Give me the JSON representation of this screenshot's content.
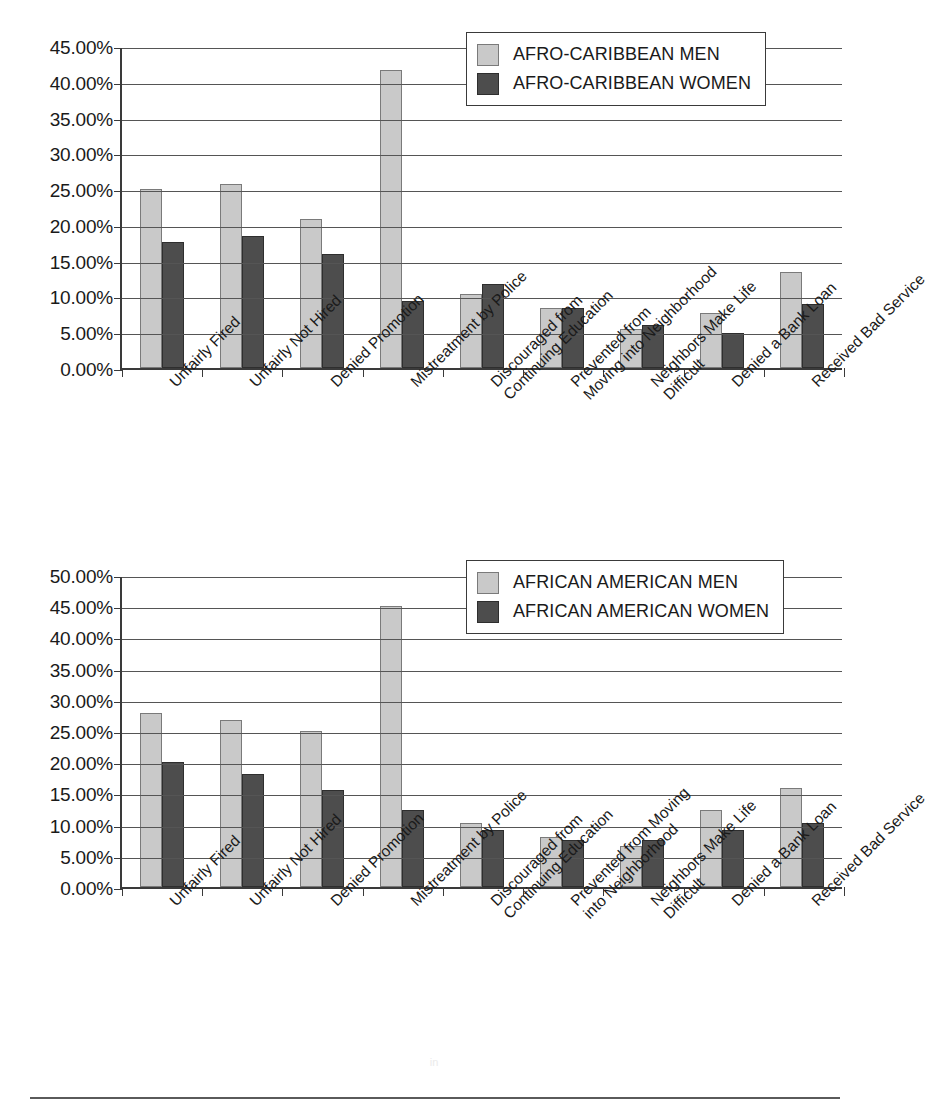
{
  "page": {
    "title_remnant": "",
    "footer_ghost": "in"
  },
  "chart_data": [
    {
      "id": "afro-caribbean",
      "type": "bar",
      "title": "",
      "xlabel": "",
      "ylabel": "",
      "ylim": [
        0,
        45
      ],
      "ytick_step": 5,
      "grid": true,
      "legend_position": "top-right",
      "ytick_labels": [
        "45.00%",
        "40.00%",
        "35.00%",
        "30.00%",
        "25.00%",
        "20.00%",
        "15.00%",
        "10.00%",
        "5.00%",
        "0.00%"
      ],
      "categories": [
        "Unfairly Fired",
        "Unfairly Not Hired",
        "Denied Promotion",
        "Mistreatment by Police",
        "Discouraged from Continuing Education",
        "Prevented from Moving into Neighborhood",
        "Neighbors Make Life Difficult",
        "Denied a Bank Loan",
        "Received Bad Service"
      ],
      "category_lines": [
        [
          "Unfairly Fired",
          ""
        ],
        [
          "Unfairly Not Hired",
          ""
        ],
        [
          "Denied Promotion",
          ""
        ],
        [
          "Mistreatment by Police",
          ""
        ],
        [
          "Discouraged from",
          "Continuing Education"
        ],
        [
          "Prevented from",
          "Moving into Neighborhood"
        ],
        [
          "Neighbors Make Life",
          "Difficult"
        ],
        [
          "Denied a Bank Loan",
          ""
        ],
        [
          "Received Bad Service",
          ""
        ]
      ],
      "series": [
        {
          "name": "AFRO-CARIBBEAN MEN",
          "color": "#c9c9c9",
          "values": [
            25.0,
            25.7,
            20.8,
            41.7,
            10.4,
            8.4,
            5.4,
            7.7,
            13.4
          ]
        },
        {
          "name": "AFRO-CARIBBEAN WOMEN",
          "color": "#4d4d4d",
          "values": [
            17.6,
            18.4,
            15.9,
            9.3,
            11.7,
            8.4,
            6.0,
            4.9,
            9.0
          ]
        }
      ]
    },
    {
      "id": "african-american",
      "type": "bar",
      "title": "",
      "xlabel": "",
      "ylabel": "",
      "ylim": [
        0,
        50
      ],
      "ytick_step": 5,
      "grid": true,
      "legend_position": "top-right",
      "ytick_labels": [
        "50.00%",
        "45.00%",
        "40.00%",
        "35.00%",
        "30.00%",
        "25.00%",
        "20.00%",
        "15.00%",
        "10.00%",
        "5.00%",
        "0.00%"
      ],
      "categories": [
        "Unfairly Fired",
        "Unfairly Not Hired",
        "Denied Promotion",
        "Mistreatment by Police",
        "Discouraged from Continuing Education",
        "Prevented from Moving into Neighborhood",
        "Neighbors Make Life Difficult",
        "Denied a Bank Loan",
        "Received Bad Service"
      ],
      "category_lines": [
        [
          "Unfairly Fired",
          ""
        ],
        [
          "Unfairly Not Hired",
          ""
        ],
        [
          "Denied Promotion",
          ""
        ],
        [
          "Mistreatment by Police",
          ""
        ],
        [
          "Discouraged from",
          "Continuing Education"
        ],
        [
          "Prevented from Moving",
          "into Neighborhood"
        ],
        [
          "Neighbors Make Life",
          "Difficult"
        ],
        [
          "Denied a Bank Loan",
          ""
        ],
        [
          "Received Bad Service",
          ""
        ]
      ],
      "series": [
        {
          "name": "AFRICAN AMERICAN MEN",
          "color": "#c9c9c9",
          "values": [
            27.9,
            26.7,
            25.0,
            45.0,
            10.2,
            8.0,
            6.5,
            12.3,
            15.9
          ]
        },
        {
          "name": "AFRICAN AMERICAN WOMEN",
          "color": "#4d4d4d",
          "values": [
            20.0,
            18.1,
            15.5,
            12.3,
            9.1,
            7.5,
            7.6,
            9.2,
            10.3
          ]
        }
      ]
    }
  ]
}
